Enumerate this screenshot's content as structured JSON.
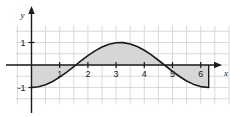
{
  "chart_data": {
    "type": "line",
    "title": "",
    "subtitle": "",
    "xlabel": "x",
    "ylabel": "y",
    "function": "y = -cos(x)",
    "xlim": [
      -0.55,
      7.0
    ],
    "ylim": [
      -1.75,
      1.75
    ],
    "grid": true,
    "grid_spacing_x": 0.5,
    "grid_spacing_y": 0.5,
    "legend": "none",
    "x_tick_labels": [
      "1",
      "2",
      "3",
      "4",
      "5",
      "6"
    ],
    "x_tick_values": [
      1,
      2,
      3,
      4,
      5,
      6
    ],
    "y_tick_labels": [
      "1",
      "-1"
    ],
    "y_tick_values": [
      1,
      -1
    ],
    "shaded_region": {
      "label": "",
      "from_x": 0,
      "to_x": 6.283,
      "baseline_y": 0
    },
    "x": [
      0,
      0.25,
      0.5,
      0.75,
      1,
      1.25,
      1.5,
      1.571,
      1.75,
      2,
      2.25,
      2.5,
      2.75,
      3,
      3.142,
      3.25,
      3.5,
      3.75,
      4,
      4.25,
      4.5,
      4.712,
      5,
      5.25,
      5.5,
      5.75,
      6,
      6.283
    ],
    "y": [
      -1,
      -0.969,
      -0.878,
      -0.732,
      -0.54,
      -0.315,
      -0.071,
      0,
      0.178,
      0.416,
      0.628,
      0.801,
      0.924,
      0.99,
      1,
      0.995,
      0.936,
      0.82,
      0.654,
      0.449,
      0.211,
      0,
      -0.284,
      -0.512,
      -0.709,
      -0.862,
      -0.96,
      -1
    ],
    "series": [
      {
        "name": "y = -cos(x)",
        "color": "#1a1a1a",
        "line_width": 1.6,
        "fill_color": "#d6d6d6"
      }
    ],
    "colors": {
      "axis": "#1a1a1a",
      "grid": "#cfcfcf",
      "fill": "#d6d6d6",
      "curve": "#1a1a1a",
      "background": "#ffffff",
      "text": "#1a1a1a"
    }
  },
  "axes": {
    "y_axis_name": "y",
    "x_axis_name": "x"
  }
}
